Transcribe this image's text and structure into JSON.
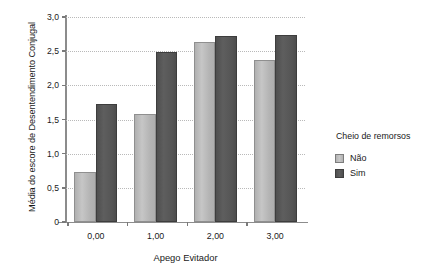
{
  "chart_data": {
    "type": "bar",
    "title": "",
    "xlabel": "Apego Evitador",
    "ylabel": "Média do escore de Desentendimento Conjugal",
    "categories": [
      "0,00",
      "1,00",
      "2,00",
      "3,00"
    ],
    "series": [
      {
        "name": "Não",
        "color": "#b8b8b8",
        "values": [
          0.73,
          1.58,
          2.63,
          2.37
        ]
      },
      {
        "name": "Sim",
        "color": "#575757",
        "values": [
          1.72,
          2.49,
          2.72,
          2.73
        ]
      }
    ],
    "ylim": [
      0,
      3.0
    ],
    "ytick_values": [
      0,
      0.5,
      1.0,
      1.5,
      2.0,
      2.5,
      3.0
    ],
    "ytick_labels": [
      "0",
      "0,5",
      "1,0",
      "1,5",
      "2,0",
      "2,5",
      "3,0"
    ],
    "grid": "horizontal-dotted",
    "legend_position": "right",
    "legend_title": "Cheio de remorsos"
  },
  "legend": {
    "title": "Cheio de remorsos",
    "entries": [
      {
        "label": "Não",
        "color": "#b8b8b8"
      },
      {
        "label": "Sim",
        "color": "#575757"
      }
    ]
  }
}
